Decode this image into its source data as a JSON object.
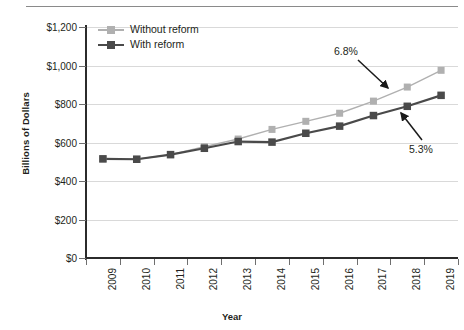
{
  "chart_data": {
    "type": "line",
    "title": "",
    "xlabel": "Year",
    "ylabel": "Billions of Dollars",
    "categories": [
      "2009",
      "2010",
      "2011",
      "2012",
      "2013",
      "2014",
      "2015",
      "2016",
      "2017",
      "2018",
      "2019"
    ],
    "ylim": [
      0,
      1200
    ],
    "ytick_values": [
      0,
      200,
      400,
      600,
      800,
      1000,
      1200
    ],
    "ytick_labels": [
      "$0",
      "$200",
      "$400",
      "$600",
      "$800",
      "$1,000",
      "$1,200"
    ],
    "grid": "horizontal",
    "legend_position": "top-left-inside",
    "series": [
      {
        "name": "Without reform",
        "color": "#b0b0b0",
        "marker": "square",
        "values": [
          515,
          513,
          537,
          578,
          618,
          668,
          710,
          752,
          815,
          888,
          975
        ]
      },
      {
        "name": "With reform",
        "color": "#4a4a4a",
        "marker": "square",
        "values": [
          515,
          513,
          537,
          570,
          605,
          602,
          648,
          685,
          740,
          788,
          845
        ]
      }
    ],
    "annotations": [
      {
        "text": "6.8%",
        "points_to_series": "Without reform",
        "label_x": 334,
        "label_y": 45,
        "arrow_from_x": 358,
        "arrow_from_y": 60,
        "arrow_to_x": 388,
        "arrow_to_y": 88
      },
      {
        "text": "5.3%",
        "points_to_series": "With reform",
        "label_x": 409,
        "label_y": 143,
        "arrow_from_x": 422,
        "arrow_from_y": 140,
        "arrow_to_x": 401,
        "arrow_to_y": 113
      }
    ]
  },
  "axes": {
    "y_title": "Billions of Dollars",
    "x_title": "Year"
  },
  "legend": {
    "items": [
      {
        "label": "Without reform",
        "color": "#b0b0b0"
      },
      {
        "label": "With reform",
        "color": "#4a4a4a"
      }
    ]
  },
  "annotations": {
    "growth_without_reform": "6.8%",
    "growth_with_reform": "5.3%"
  }
}
